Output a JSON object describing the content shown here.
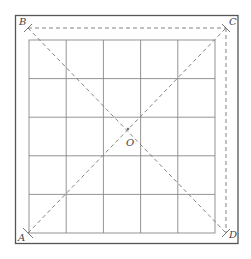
{
  "diagram": {
    "type": "geometry-grid",
    "grid": {
      "rows": 5,
      "cols": 5
    },
    "points": {
      "A": {
        "label": "A",
        "position": "bottom-left"
      },
      "B": {
        "label": "B",
        "position": "top-left"
      },
      "C": {
        "label": "C",
        "position": "top-right"
      },
      "D": {
        "label": "D",
        "position": "bottom-right"
      },
      "O": {
        "label": "O",
        "position": "center-intersection"
      }
    },
    "segments": [
      {
        "from": "A",
        "to": "C",
        "style": "dashed"
      },
      {
        "from": "B",
        "to": "D",
        "style": "dashed"
      },
      {
        "from": "B",
        "to": "C",
        "style": "dashed"
      },
      {
        "from": "C",
        "to": "D",
        "style": "dashed"
      }
    ],
    "colors": {
      "frame": "#555555",
      "grid": "#888888",
      "dashed": "#777777",
      "label": "#444444"
    }
  }
}
